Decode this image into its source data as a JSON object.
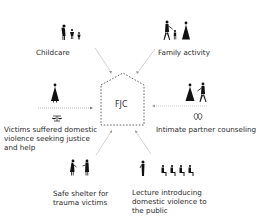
{
  "diagram": {
    "center": {
      "label": "FJC",
      "shape": "house-dashed"
    },
    "nodes": [
      {
        "id": "childcare",
        "label": "Childcare",
        "icon": "adult-with-children-icon"
      },
      {
        "id": "family_activity",
        "label": "Family activity",
        "icon": "family-walking-icon"
      },
      {
        "id": "victims",
        "label_lines": [
          "Victims suffered domestic",
          "violence seeking justice",
          "and help"
        ],
        "icon": "woman-with-scales-icon"
      },
      {
        "id": "counseling",
        "label": "Intimate partner counseling",
        "icon": "couple-with-hearts-icon"
      },
      {
        "id": "shelter",
        "label_lines": [
          "Safe shelter for",
          "trauma victims"
        ],
        "icon": "two-women-talking-icon"
      },
      {
        "id": "lecture",
        "label_lines": [
          "Lecture introducing",
          "domestic violence to",
          "the public"
        ],
        "icon": "lecturer-with-audience-icon"
      }
    ],
    "colors": {
      "arrow": "#b8b8b8",
      "dashed_arrow": "#9a9a9a",
      "house": "#555555",
      "icon": "#111111",
      "text": "#2a2a2a"
    }
  }
}
